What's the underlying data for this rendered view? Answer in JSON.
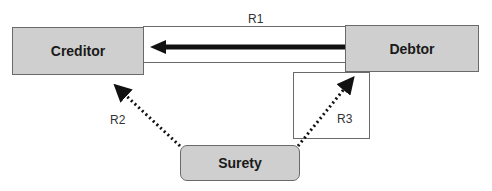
{
  "diagram": {
    "nodes": {
      "creditor": "Creditor",
      "debtor": "Debtor",
      "surety": "Surety"
    },
    "relations": {
      "r1": "R1",
      "r2": "R2",
      "r3": "R3"
    },
    "colors": {
      "node_fill": "#cfcfcf",
      "border": "#6a6a6a",
      "arrow": "#111111"
    }
  }
}
